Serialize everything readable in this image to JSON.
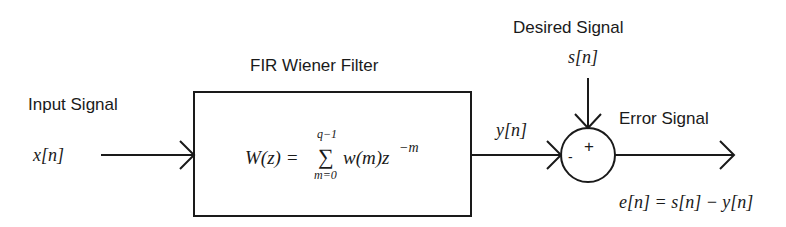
{
  "diagram": {
    "type": "block-diagram",
    "title": "FIR Wiener Filter",
    "input": {
      "label": "Input Signal",
      "symbol": "x[n]"
    },
    "filter": {
      "label": "FIR Wiener Filter",
      "equation_lhs": "W(z) =",
      "sum_symbol": "∑",
      "sum_upper": "q−1",
      "sum_lower": "m=0",
      "equation_rhs": "w(m)z",
      "exponent": "−m"
    },
    "output": {
      "symbol": "y[n]"
    },
    "desired": {
      "label": "Desired Signal",
      "symbol": "s[n]"
    },
    "summer": {
      "minus_sign": "-",
      "plus_sign": "+"
    },
    "error": {
      "label": "Error Signal",
      "equation": "e[n] = s[n] − y[n]"
    },
    "colors": {
      "stroke": "#1a1a1a",
      "background": "#ffffff"
    }
  }
}
